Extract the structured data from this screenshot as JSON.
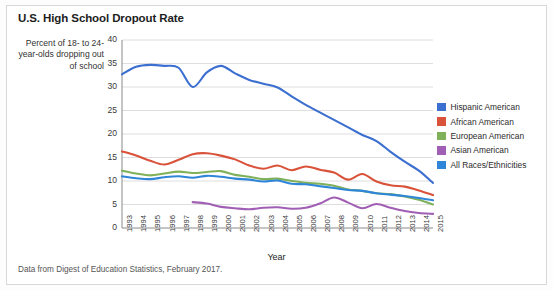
{
  "title": "U.S. High School Dropout Rate",
  "caption": "Data from Digest of Education Statistics, February 2017.",
  "y_axis_label": "Percent of 18- to 24-year-olds dropping out of school",
  "legend": {
    "items": [
      {
        "label": "Hispanic American",
        "color": "#3b6fd0"
      },
      {
        "label": "African American",
        "color": "#d9523a"
      },
      {
        "label": "European American",
        "color": "#7fb05a"
      },
      {
        "label": "Asian American",
        "color": "#a05fb4"
      },
      {
        "label": "All Races/Ethnicities",
        "color": "#2f86d8"
      }
    ]
  },
  "chart_data": {
    "type": "line",
    "title": "U.S. High School Dropout Rate",
    "xlabel": "Year",
    "ylabel": "Percent of 18- to 24-year-olds dropping out of school",
    "ylim": [
      0,
      40
    ],
    "yticks": [
      0,
      5,
      10,
      15,
      20,
      25,
      30,
      35,
      40
    ],
    "grid": true,
    "legend_position": "right",
    "categories": [
      "1993",
      "1994",
      "1995",
      "1996",
      "1997",
      "1998",
      "1999",
      "2000",
      "2001",
      "2002",
      "2003",
      "2004",
      "2005",
      "2006",
      "2007",
      "2008",
      "2009",
      "2010",
      "2011",
      "2012",
      "2013",
      "2014",
      "2015"
    ],
    "series": [
      {
        "name": "Hispanic American",
        "color": "#3b6fd0",
        "values": [
          32.7,
          34.3,
          34.7,
          34.5,
          34.1,
          30.0,
          33.1,
          34.5,
          32.9,
          31.5,
          30.7,
          29.9,
          28.0,
          26.2,
          24.6,
          23.0,
          21.4,
          19.8,
          18.5,
          16.2,
          14.1,
          12.2,
          9.6
        ]
      },
      {
        "name": "African American",
        "color": "#d9523a",
        "values": [
          16.3,
          15.4,
          14.3,
          13.5,
          14.5,
          15.7,
          15.9,
          15.4,
          14.6,
          13.3,
          12.6,
          13.3,
          12.3,
          13.1,
          12.4,
          11.8,
          10.3,
          11.5,
          9.9,
          9.1,
          8.8,
          8.0,
          7.0
        ]
      },
      {
        "name": "European American",
        "color": "#7fb05a",
        "values": [
          12.2,
          11.6,
          11.2,
          11.6,
          12.0,
          11.7,
          11.9,
          12.1,
          11.3,
          10.9,
          10.4,
          10.5,
          10.0,
          9.6,
          9.4,
          9.0,
          8.2,
          7.9,
          7.4,
          7.2,
          6.7,
          6.0,
          5.0
        ]
      },
      {
        "name": "Asian American",
        "color": "#a05fb4",
        "values": [
          null,
          null,
          null,
          null,
          null,
          5.5,
          5.2,
          4.5,
          4.2,
          4.0,
          4.3,
          4.4,
          4.1,
          4.3,
          5.2,
          6.5,
          5.4,
          4.2,
          5.1,
          4.3,
          3.6,
          3.2,
          3.0
        ]
      },
      {
        "name": "All Races/Ethnicities",
        "color": "#2f86d8",
        "values": [
          11.0,
          10.6,
          10.4,
          10.8,
          11.0,
          10.7,
          11.1,
          10.9,
          10.5,
          10.3,
          9.9,
          10.1,
          9.4,
          9.3,
          8.9,
          8.5,
          8.1,
          7.9,
          7.4,
          7.1,
          6.8,
          6.4,
          5.9
        ]
      }
    ]
  }
}
